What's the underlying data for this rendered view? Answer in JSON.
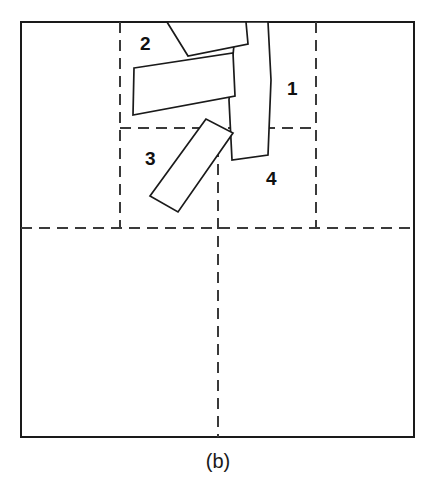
{
  "figure": {
    "caption": "(b)",
    "frame": {
      "x": 21,
      "y": 22,
      "width": 393,
      "height": 415
    },
    "colors": {
      "background": "#ffffff",
      "frame_stroke": "#1a1a1a",
      "grid_stroke": "#3a3a3a",
      "piece_stroke": "#1a1a1a",
      "piece_fill": "#ffffff",
      "label_fill": "#111111"
    },
    "grid_lines": [
      {
        "name": "vertical-left",
        "orientation": "vertical",
        "x1": 120,
        "y1": 22,
        "x2": 120,
        "y2": 228
      },
      {
        "name": "vertical-center",
        "orientation": "vertical",
        "x1": 218,
        "y1": 128,
        "x2": 218,
        "y2": 437
      },
      {
        "name": "vertical-right",
        "orientation": "vertical",
        "x1": 316,
        "y1": 22,
        "x2": 316,
        "y2": 228
      },
      {
        "name": "horizontal-upper",
        "orientation": "horizontal",
        "x1": 120,
        "y1": 128,
        "x2": 316,
        "y2": 128
      },
      {
        "name": "horizontal-lower",
        "orientation": "horizontal",
        "x1": 21,
        "y1": 228,
        "x2": 414,
        "y2": 228
      }
    ],
    "pieces": [
      {
        "id": "piece-1",
        "label": "1",
        "label_x": 287,
        "label_y": 95,
        "points": "236,22 229,100 232,160 268,155 271,80 268,22"
      },
      {
        "id": "piece-2",
        "label": "2",
        "label_x": 140,
        "label_y": 50,
        "points": "167,22 188,56 248,44 246,22"
      },
      {
        "id": "piece-3",
        "label": "3",
        "label_x": 145,
        "label_y": 165,
        "points": "206,119 150,196 178,212 233,133"
      },
      {
        "id": "piece-4",
        "label": "4",
        "label_x": 266,
        "label_y": 185,
        "points": "134,68 233,53 235,96 133,115"
      }
    ],
    "caption_position": {
      "x": 218,
      "y": 468
    }
  }
}
